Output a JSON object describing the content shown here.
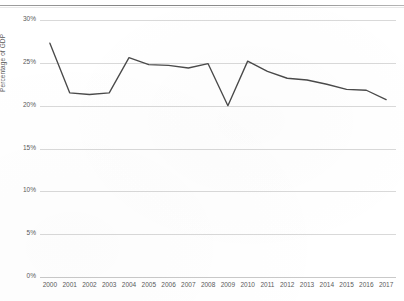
{
  "chart_data": {
    "type": "line",
    "title": "",
    "xlabel": "",
    "ylabel": "Percentage of GDP",
    "categories": [
      "2000",
      "2001",
      "2002",
      "2003",
      "2004",
      "2005",
      "2006",
      "2007",
      "2008",
      "2009",
      "2010",
      "2011",
      "2012",
      "2013",
      "2014",
      "2015",
      "2016",
      "2017"
    ],
    "values": [
      27.3,
      21.5,
      21.3,
      21.5,
      25.6,
      24.8,
      24.7,
      24.4,
      24.9,
      20.0,
      25.2,
      24.0,
      23.2,
      23.0,
      22.5,
      21.9,
      21.8,
      20.7
    ],
    "series": [
      {
        "name": "Percentage of GDP",
        "values": [
          27.3,
          21.5,
          21.3,
          21.5,
          25.6,
          24.8,
          24.7,
          24.4,
          24.9,
          20.0,
          25.2,
          24.0,
          23.2,
          23.0,
          22.5,
          21.9,
          21.8,
          20.7
        ]
      }
    ],
    "ylim": [
      0,
      30
    ],
    "yticks": [
      0,
      5,
      10,
      15,
      20,
      25,
      30
    ],
    "ytick_labels": [
      "0%",
      "5%",
      "10%",
      "15%",
      "20%",
      "25%",
      "30%"
    ],
    "grid": true,
    "legend": false,
    "legend_position": "none",
    "line_color": "#4a4a4a",
    "gridline_color": "#d9d9d9",
    "background_color": "#ffffff",
    "text_color": "#5a5a5a"
  }
}
